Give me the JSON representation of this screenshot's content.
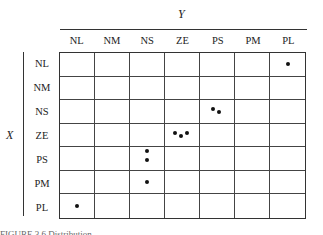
{
  "chart_data": {
    "type": "table",
    "title": "",
    "xlabel": "X",
    "ylabel": "Y",
    "columns": [
      "NL",
      "NM",
      "NS",
      "ZE",
      "PS",
      "PM",
      "PL"
    ],
    "rows": [
      "NL",
      "NM",
      "NS",
      "ZE",
      "PS",
      "PM",
      "PL"
    ],
    "points": [
      {
        "row": "NL",
        "col": "PL",
        "count": 1
      },
      {
        "row": "NS",
        "col": "PS",
        "count": 2
      },
      {
        "row": "ZE",
        "col": "ZE",
        "count": 3
      },
      {
        "row": "PS",
        "col": "NS",
        "count": 2
      },
      {
        "row": "PM",
        "col": "NS",
        "count": 1
      },
      {
        "row": "PL",
        "col": "NL",
        "count": 1
      }
    ],
    "grid": true
  },
  "axes": {
    "y_title": "Y",
    "x_title": "X"
  },
  "columns": [
    "NL",
    "NM",
    "NS",
    "ZE",
    "PS",
    "PM",
    "PL"
  ],
  "rows": [
    "NL",
    "NM",
    "NS",
    "ZE",
    "PS",
    "PM",
    "PL"
  ],
  "dots": {
    "0-6": [
      [
        50,
        50
      ]
    ],
    "2-4": [
      [
        38,
        38
      ],
      [
        56,
        52
      ]
    ],
    "3-3": [
      [
        30,
        40
      ],
      [
        46,
        55
      ],
      [
        64,
        42
      ]
    ],
    "4-2": [
      [
        50,
        18
      ],
      [
        50,
        55
      ]
    ],
    "5-2": [
      [
        50,
        50
      ]
    ],
    "6-0": [
      [
        50,
        50
      ]
    ]
  },
  "caption": "FIGURE 3.6   Distribution ..."
}
